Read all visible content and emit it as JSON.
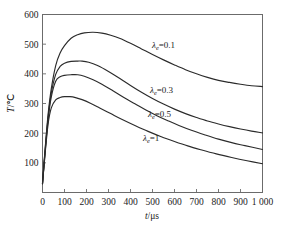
{
  "chart_data": {
    "type": "line",
    "title": "",
    "xlabel": "t/μs",
    "ylabel": "T/℃",
    "xlim": [
      0,
      1000
    ],
    "ylim": [
      0,
      600
    ],
    "xticks": [
      0,
      100,
      200,
      300,
      400,
      500,
      600,
      700,
      800,
      900,
      1000
    ],
    "xticklabels": [
      "0",
      "100",
      "200",
      "300",
      "400",
      "500",
      "600",
      "700",
      "800",
      "900",
      "1 000"
    ],
    "yticks": [
      0,
      100,
      200,
      300,
      400,
      500,
      600
    ],
    "yticklabels": [
      "",
      "100",
      "200",
      "300",
      "400",
      "500",
      "600"
    ],
    "grid": false,
    "legend_position": "inline-annotations",
    "curve_color": "#2b2b2b",
    "frame_color": "#6b6b6b",
    "series": [
      {
        "name": "λ_e=0.1",
        "label_symbol": "λ",
        "label_sub": "e",
        "label_value": "=0.1",
        "peak_x": 230,
        "peak_y": 540,
        "x": [
          0,
          10,
          25,
          40,
          60,
          80,
          100,
          130,
          160,
          190,
          230,
          270,
          310,
          350,
          400,
          450,
          500,
          550,
          600,
          650,
          700,
          750,
          800,
          850,
          900,
          950,
          1000
        ],
        "y": [
          30,
          130,
          260,
          350,
          428,
          470,
          495,
          520,
          532,
          538,
          540,
          537,
          530,
          520,
          503,
          484,
          465,
          447,
          430,
          414,
          400,
          388,
          378,
          371,
          365,
          360,
          357
        ]
      },
      {
        "name": "λ_e=0.3",
        "label_symbol": "λ",
        "label_sub": "e",
        "label_value": "=0.3",
        "peak_x": 180,
        "peak_y": 443,
        "x": [
          0,
          10,
          25,
          40,
          60,
          80,
          100,
          130,
          160,
          180,
          210,
          250,
          300,
          350,
          400,
          450,
          500,
          550,
          600,
          650,
          700,
          750,
          800,
          850,
          900,
          950,
          1000
        ],
        "y": [
          30,
          125,
          250,
          335,
          398,
          425,
          436,
          442,
          443,
          443,
          439,
          428,
          408,
          385,
          361,
          338,
          317,
          298,
          281,
          266,
          253,
          241,
          231,
          222,
          214,
          207,
          201
        ]
      },
      {
        "name": "λ_e=0.5",
        "label_symbol": "λ",
        "label_sub": "e",
        "label_value": "=0.5",
        "peak_x": 160,
        "peak_y": 397,
        "x": [
          0,
          10,
          25,
          40,
          60,
          80,
          100,
          130,
          160,
          190,
          230,
          270,
          320,
          370,
          420,
          470,
          520,
          570,
          620,
          680,
          740,
          800,
          860,
          920,
          1000
        ],
        "y": [
          30,
          120,
          242,
          322,
          375,
          390,
          395,
          397,
          397,
          392,
          380,
          365,
          343,
          320,
          299,
          278,
          259,
          242,
          226,
          209,
          194,
          180,
          168,
          158,
          145
        ]
      },
      {
        "name": "λ_e=1",
        "label_symbol": "λ",
        "label_sub": "e",
        "label_value": "=1",
        "peak_x": 125,
        "peak_y": 323,
        "x": [
          0,
          10,
          25,
          40,
          60,
          80,
          100,
          125,
          150,
          180,
          220,
          260,
          310,
          360,
          420,
          480,
          540,
          600,
          660,
          720,
          790,
          860,
          930,
          1000
        ],
        "y": [
          30,
          115,
          228,
          285,
          312,
          320,
          323,
          323,
          320,
          313,
          300,
          285,
          266,
          247,
          226,
          206,
          188,
          172,
          157,
          144,
          130,
          118,
          107,
          97
        ]
      }
    ],
    "annotations": [
      {
        "text": "λe=0.1",
        "x_px": 152,
        "y_px": 48
      },
      {
        "text": "λe=0.3",
        "x_px": 150,
        "y_px": 93
      },
      {
        "text": "λe=0.5",
        "x_px": 148,
        "y_px": 117
      },
      {
        "text": "λe=1",
        "x_px": 143,
        "y_px": 141
      }
    ]
  }
}
